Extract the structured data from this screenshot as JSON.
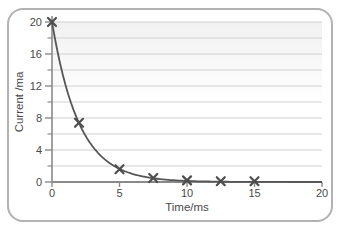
{
  "figure": {
    "card_border_color": "#b2b2b2",
    "card_background": "#ffffff"
  },
  "chart_data": {
    "type": "line",
    "title": "",
    "xlabel": "Time/ms",
    "ylabel": "Current /ma",
    "xlim": [
      0,
      20
    ],
    "ylim": [
      0,
      20
    ],
    "x_ticks": [
      0,
      5,
      10,
      15,
      20
    ],
    "y_ticks": [
      0,
      4,
      8,
      12,
      16,
      20
    ],
    "y_minor_ticks": [
      2,
      6,
      10,
      14,
      18
    ],
    "grid": {
      "horizontal_step": 2,
      "vertical": false
    },
    "legend": "none",
    "marker_style": "x",
    "x": [
      0,
      2,
      5,
      7.5,
      10,
      12.5,
      15
    ],
    "series": [
      {
        "name": "discharge-current",
        "values": [
          20,
          7.4,
          1.6,
          0.5,
          0.2,
          0.1,
          0.1
        ],
        "curve_model": {
          "kind": "exponential-decay",
          "y0": 20,
          "tau_ms": 2,
          "t_range": [
            0,
            20
          ]
        }
      }
    ],
    "colors": {
      "curve": "#565656",
      "marker": "#4d4d4d",
      "grid": "#d0d0d0",
      "axis": "#8a8a8a",
      "tick_label": "#4a4a4a",
      "plot_top_shade": "#000000"
    }
  }
}
